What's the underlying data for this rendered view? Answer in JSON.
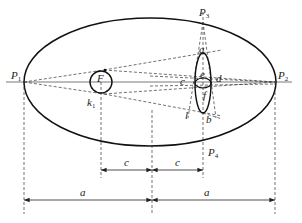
{
  "diagram": {
    "type": "geometric-construction",
    "labels": {
      "p1": "P",
      "p1_sub": "1",
      "p2": "P",
      "p2_sub": "2",
      "p3": "P",
      "p3_sub": "3",
      "p4": "P",
      "p4_sub": "4",
      "focus": "F",
      "focus_mark": "k",
      "focus_mark_sub": "1",
      "point_a": "a",
      "point_b": "b",
      "point_c": "c",
      "point_d": "d",
      "point_e": "e",
      "point_f": "f",
      "point_l": "l"
    },
    "dimensions": {
      "c_left": "c",
      "c_right": "c",
      "a_left": "a",
      "a_right": "a"
    },
    "colors": {
      "stroke": "#111111",
      "dash": "#333333",
      "background": "#ffffff"
    }
  }
}
